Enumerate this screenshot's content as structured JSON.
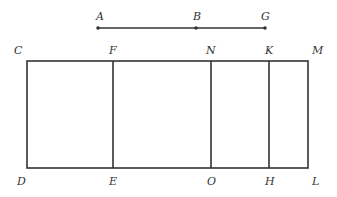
{
  "diagram": {
    "stroke_color": "#333333",
    "label_color": "#333333",
    "top_line": {
      "points": [
        {
          "label": "A",
          "x": 98,
          "y": 28,
          "label_x": 96,
          "label_y": 20
        },
        {
          "label": "B",
          "x": 196,
          "y": 28,
          "label_x": 193,
          "label_y": 20
        },
        {
          "label": "G",
          "x": 265,
          "y": 28,
          "label_x": 261,
          "label_y": 20
        }
      ]
    },
    "rectangle": {
      "top_y": 61,
      "bottom_y": 168,
      "left_x": 27,
      "right_x": 308
    },
    "top_labels": [
      {
        "label": "C",
        "x": 14,
        "y": 54
      },
      {
        "label": "F",
        "x": 109,
        "y": 54
      },
      {
        "label": "N",
        "x": 206,
        "y": 54
      },
      {
        "label": "K",
        "x": 265,
        "y": 54
      },
      {
        "label": "M",
        "x": 312,
        "y": 54
      }
    ],
    "bottom_labels": [
      {
        "label": "D",
        "x": 17,
        "y": 185
      },
      {
        "label": "E",
        "x": 109,
        "y": 185
      },
      {
        "label": "O",
        "x": 207,
        "y": 185
      },
      {
        "label": "H",
        "x": 265,
        "y": 185
      },
      {
        "label": "L",
        "x": 312,
        "y": 185
      }
    ],
    "dividers": [
      {
        "name": "FE",
        "x": 113
      },
      {
        "name": "NO",
        "x": 211
      },
      {
        "name": "KH",
        "x": 269
      }
    ]
  }
}
